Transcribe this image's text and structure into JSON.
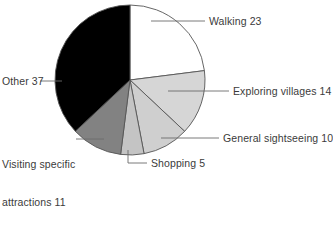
{
  "chart_data": {
    "type": "pie",
    "title": "",
    "subtitle": "",
    "xlabel": "",
    "ylabel": "",
    "legend_position": "none",
    "grid": false,
    "total": 100,
    "units": "percent",
    "start_angle_deg": 0,
    "direction": "clockwise",
    "categories": [
      "Walking",
      "Exploring villages",
      "General sightseeing",
      "Shopping",
      "Visiting specific attractions",
      "Other"
    ],
    "values": [
      23,
      14,
      10,
      5,
      11,
      37
    ],
    "slices": [
      {
        "label": "Walking",
        "value": 23,
        "label_text": "Walking 23",
        "color": "#ffffff",
        "stroke": "#555555"
      },
      {
        "label": "Exploring villages",
        "value": 14,
        "label_text": "Exploring villages 14",
        "color": "#d6d6d6",
        "stroke": "#555555"
      },
      {
        "label": "General sightseeing",
        "value": 10,
        "label_text": "General sightseeing 10",
        "color": "#cfcfcf",
        "stroke": "#555555"
      },
      {
        "label": "Shopping",
        "value": 5,
        "label_text": "Shopping 5",
        "color": "#c4c4c4",
        "stroke": "#555555"
      },
      {
        "label": "Visiting specific attractions",
        "value": 11,
        "label_text": "Visiting specific",
        "label_text_line2": "attractions 11",
        "color": "#828282",
        "stroke": "#555555"
      },
      {
        "label": "Other",
        "value": 37,
        "label_text": "Other 37",
        "color": "#000000",
        "stroke": "#555555"
      }
    ],
    "geometry": {
      "center_x": 130,
      "center_y": 80,
      "radius": 75
    },
    "colors": {
      "leader_line": "#6b6b6b",
      "slice_outline": "#555555",
      "text": "#3b3b3b",
      "background": "#ffffff"
    }
  }
}
